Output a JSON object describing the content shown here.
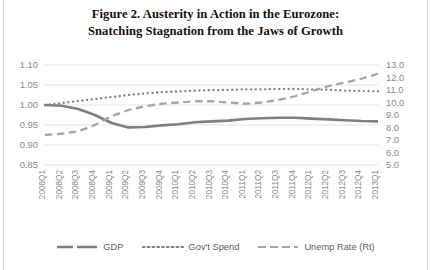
{
  "title": {
    "line1": "Figure 2. Austerity in Action in the Eurozone:",
    "line2": "Snatching Stagnation from the Jaws of Growth"
  },
  "colors": {
    "gdp": "#7f7f7f",
    "gov_spend": "#808080",
    "unemp": "#a6a6a6",
    "gridline": "#e3e3e3",
    "axis_text": "#8a8a8a",
    "title_text": "#15100c",
    "background": "#ffffff"
  },
  "legend": {
    "position": "bottom",
    "items": [
      {
        "label": "GDP",
        "style": "solid",
        "color": "#7f7f7f"
      },
      {
        "label": "Gov't Spend",
        "style": "dotted",
        "color": "#808080"
      },
      {
        "label": "Unemp Rate (Rt)",
        "style": "dashed",
        "color": "#a6a6a6"
      }
    ]
  },
  "chart_data": {
    "type": "line",
    "title": "Figure 2. Austerity in Action in the Eurozone: Snatching Stagnation from the Jaws of Growth",
    "xlabel": "",
    "ylabel": "",
    "grid": true,
    "categories": [
      "2008Q1",
      "2008Q2",
      "2008Q3",
      "2008Q4",
      "2009Q1",
      "2009Q2",
      "2009Q3",
      "2009Q4",
      "2010Q1",
      "2010Q2",
      "2010Q3",
      "2010Q4",
      "2011Q1",
      "2011Q2",
      "2011Q3",
      "2011Q4",
      "2012Q1",
      "2012Q2",
      "2012Q3",
      "2012Q4",
      "2013Q1"
    ],
    "left_axis": {
      "ticks": [
        "0.85",
        "0.90",
        "0.95",
        "1.00",
        "1.05",
        "1.10"
      ],
      "ylim": [
        0.85,
        1.1
      ],
      "step": 0.05
    },
    "right_axis": {
      "ticks": [
        "5.0",
        "6.0",
        "7.0",
        "8.0",
        "9.0",
        "10.0",
        "11.0",
        "12.0",
        "13.0"
      ],
      "ylim": [
        5.0,
        13.0
      ],
      "step": 1.0
    },
    "series": [
      {
        "name": "GDP",
        "axis": "left",
        "style": "solid",
        "color": "#7f7f7f",
        "values": [
          1.0,
          0.998,
          0.99,
          0.975,
          0.955,
          0.944,
          0.945,
          0.949,
          0.952,
          0.957,
          0.959,
          0.961,
          0.965,
          0.967,
          0.968,
          0.968,
          0.966,
          0.964,
          0.962,
          0.96,
          0.959
        ]
      },
      {
        "name": "Gov't Spend",
        "axis": "left",
        "style": "dotted",
        "color": "#808080",
        "values": [
          1.0,
          1.005,
          1.01,
          1.015,
          1.02,
          1.025,
          1.029,
          1.032,
          1.034,
          1.036,
          1.037,
          1.038,
          1.039,
          1.039,
          1.04,
          1.04,
          1.039,
          1.038,
          1.036,
          1.035,
          1.034
        ]
      },
      {
        "name": "Unemp Rate (Rt)",
        "axis": "right",
        "style": "dashed",
        "color": "#a6a6a6",
        "values": [
          7.4,
          7.5,
          7.7,
          8.2,
          8.9,
          9.4,
          9.7,
          9.9,
          10.0,
          10.1,
          10.1,
          10.0,
          9.9,
          10.0,
          10.2,
          10.5,
          10.9,
          11.3,
          11.6,
          11.9,
          12.3
        ]
      }
    ]
  }
}
